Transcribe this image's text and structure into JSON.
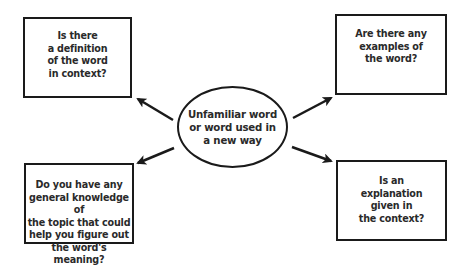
{
  "diagram": {
    "type": "concept-map",
    "center": {
      "label": "Unfamiliar word\nor word used in\na new way",
      "shape": "ellipse"
    },
    "nodes": [
      {
        "id": "top-left",
        "label": "Is there\na definition\nof the word\nin context?"
      },
      {
        "id": "top-right",
        "label": "Are there any\nexamples of\nthe word?"
      },
      {
        "id": "bottom-left",
        "label": "Do you have any\ngeneral knowledge of\nthe topic that could\nhelp you figure out\nthe word's meaning?"
      },
      {
        "id": "bottom-right",
        "label": "Is an\nexplanation\ngiven in\nthe context?"
      }
    ],
    "edges": [
      {
        "from": "center",
        "to": "top-left"
      },
      {
        "from": "center",
        "to": "top-right"
      },
      {
        "from": "center",
        "to": "bottom-left"
      },
      {
        "from": "center",
        "to": "bottom-right"
      }
    ],
    "colors": {
      "stroke": "#1a1a1a",
      "text": "#2a2a2a",
      "background": "#ffffff"
    }
  }
}
